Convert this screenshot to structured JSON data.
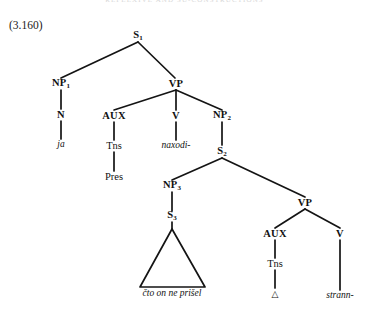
{
  "page": {
    "running_head": "REFLEXIVE AND SU-CONSTRUCTIONS",
    "example_number": "(3.160)"
  },
  "diagram": {
    "type": "phrase-structure-tree",
    "root_label": "S",
    "triangle_note": "abbreviated constituent",
    "nodes": {
      "s1": {
        "label": "S",
        "sub": "1"
      },
      "np1": {
        "label": "NP",
        "sub": "1"
      },
      "vp1": {
        "label": "VP",
        "sub": ""
      },
      "n1": {
        "label": "N",
        "sub": ""
      },
      "aux1": {
        "label": "AUX",
        "sub": ""
      },
      "v1": {
        "label": "V",
        "sub": ""
      },
      "np2": {
        "label": "NP",
        "sub": "2"
      },
      "ja": {
        "label": "ja",
        "sub": ""
      },
      "tns1": {
        "label": "Tns",
        "sub": ""
      },
      "naxodi": {
        "label": "naxodi-",
        "sub": ""
      },
      "s2": {
        "label": "S",
        "sub": "2"
      },
      "pres": {
        "label": "Pres",
        "sub": ""
      },
      "np3": {
        "label": "NP",
        "sub": "3"
      },
      "vp2": {
        "label": "VP",
        "sub": ""
      },
      "s3": {
        "label": "S",
        "sub": "3"
      },
      "aux2": {
        "label": "AUX",
        "sub": ""
      },
      "v2": {
        "label": "V",
        "sub": ""
      },
      "cto": {
        "label": "čto on ne prišel",
        "sub": ""
      },
      "tns2": {
        "label": "Tns",
        "sub": ""
      },
      "delta": {
        "label": "△",
        "sub": ""
      },
      "strann": {
        "label": "strann-",
        "sub": ""
      }
    },
    "edges": [
      "s1-np1",
      "s1-vp1",
      "np1-n1",
      "n1-ja",
      "vp1-aux1",
      "vp1-v1",
      "vp1-np2",
      "aux1-tns1",
      "tns1-pres",
      "v1-naxodi",
      "np2-s2",
      "s2-np3",
      "s2-vp2",
      "np3-s3",
      "s3-triangle",
      "vp2-aux2",
      "vp2-v2",
      "aux2-tns2",
      "tns2-delta",
      "v2-strann"
    ]
  }
}
